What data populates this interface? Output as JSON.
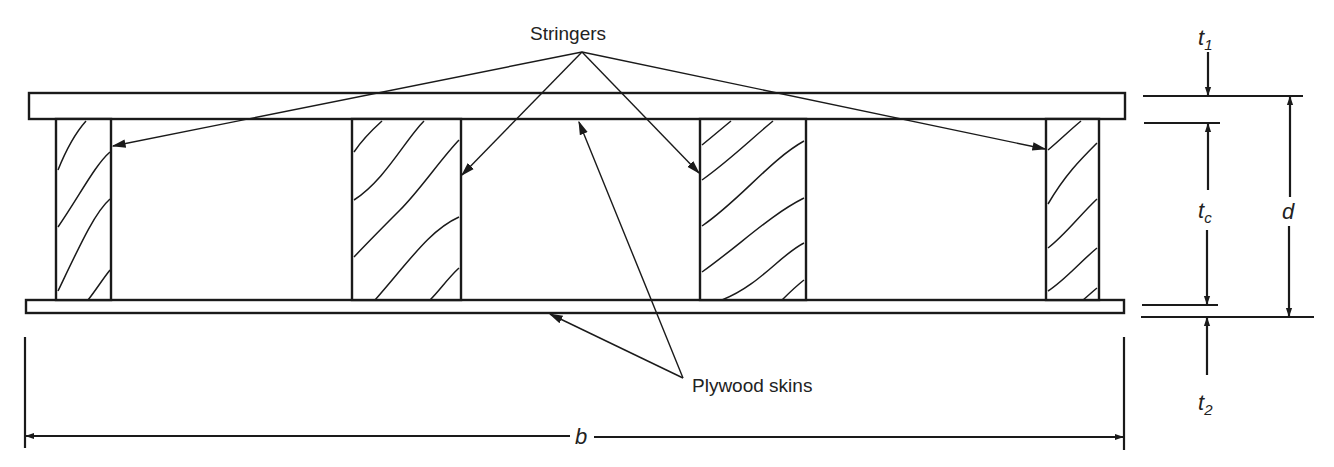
{
  "figure": {
    "type": "cross-section"
  },
  "labels": {
    "stringers": "Stringers",
    "plywood_skins": "Plywood skins"
  },
  "dimensions": {
    "t1": {
      "base": "t",
      "sub": "1"
    },
    "tc": {
      "base": "t",
      "sub": "c"
    },
    "t2": {
      "base": "t",
      "sub": "2"
    },
    "d": "d",
    "b": "b"
  },
  "colors": {
    "ink": "#1a1a1a",
    "background": "#ffffff"
  },
  "stringer_count": 4
}
